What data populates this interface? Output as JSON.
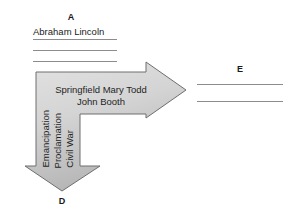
{
  "diagram": {
    "type": "bent-double-headed-arrow-graphic-organizer",
    "background_color": "#ffffff",
    "arrow": {
      "fill_top_color": "#dcdcdc",
      "fill_bottom_color": "#b9b9b9",
      "stroke_color": "#6e6e6e",
      "right_body_text_line1": "Springfield Mary Todd",
      "right_body_text_line2": "John Booth",
      "down_body_text_line1": "Emancipation",
      "down_body_text_line2": "Proclamation",
      "down_body_text_line3": "Civil War"
    },
    "section_a": {
      "letter": "A",
      "text": "Abraham Lincoln",
      "blank_line_count": 3,
      "line_color": "#8c8c8c"
    },
    "section_d": {
      "letter": "D"
    },
    "section_e": {
      "letter": "E",
      "blank_line_count": 2,
      "line_color": "#8c8c8c"
    }
  }
}
